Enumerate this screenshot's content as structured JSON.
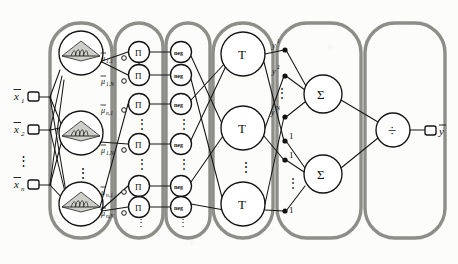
{
  "figure": {
    "type": "diagram",
    "layer_count": 6
  },
  "colors": {
    "layer_border": "#8a8a84",
    "line": "#1a1a1a",
    "node_border": "#1a1a1a",
    "node_fill": "#ffffff",
    "background": "#fcfcfa",
    "text": "#111111"
  },
  "inputs": [
    {
      "label": "x̄1",
      "base": "x",
      "overbar": true,
      "sub": "1",
      "y": 97
    },
    {
      "label": "x̄2",
      "base": "x",
      "overbar": true,
      "sub": "2",
      "y": 130
    },
    {
      "label": "x̄n",
      "base": "x",
      "overbar": true,
      "sub": "n",
      "y": 185
    }
  ],
  "input_vdots": "⋮",
  "layers": [
    {
      "index": 1,
      "name": "membership-layer",
      "x": 50,
      "w": 62
    },
    {
      "index": 2,
      "name": "product-layer",
      "x": 114,
      "w": 50
    },
    {
      "index": 3,
      "name": "negation-layer",
      "x": 166,
      "w": 44
    },
    {
      "index": 4,
      "name": "tnorm-layer",
      "x": 212,
      "w": 62
    },
    {
      "index": 5,
      "name": "summation-layer",
      "x": 276,
      "w": 86
    },
    {
      "index": 6,
      "name": "division-layer",
      "x": 364,
      "w": 82
    }
  ],
  "membership_nodes": [
    {
      "label": "gaussian-membership",
      "cy": 53
    },
    {
      "label": "gaussian-membership",
      "cy": 133
    },
    {
      "label": "gaussian-membership",
      "cy": 204
    }
  ],
  "membership_vdots": "⋮",
  "product_nodes": [
    {
      "symbol": "Π",
      "cy": 52,
      "weight": "μ̄1,1"
    },
    {
      "symbol": "Π",
      "cy": 75,
      "weight": "μ̄1,N"
    },
    {
      "symbol": "Π",
      "cy": 104,
      "weight": "μ̄n,1"
    },
    {
      "symbol": "Π",
      "cy": 144,
      "weight": "μ̄1,N"
    },
    {
      "symbol": "Π",
      "cy": 186,
      "weight": "μ̄n,1"
    },
    {
      "symbol": "Π",
      "cy": 207,
      "weight": "μ̄n,N"
    }
  ],
  "product_symbol": "Π",
  "product_vdots": "⋮",
  "weight_labels": [
    {
      "text": "μ̄1,1",
      "greek": "μ",
      "sub": "1,1",
      "x": 101,
      "y": 59
    },
    {
      "text": "μ̄1,N",
      "greek": "μ",
      "sub": "1,N",
      "x": 101,
      "y": 82
    },
    {
      "text": "μ̄n,1",
      "greek": "μ",
      "sub": "n,1",
      "x": 101,
      "y": 111
    },
    {
      "text": "μ̄1,N",
      "greek": "μ",
      "sub": "1,N",
      "x": 101,
      "y": 151
    },
    {
      "text": "μ̄n,1",
      "greek": "μ",
      "sub": "n,1",
      "x": 101,
      "y": 193
    },
    {
      "text": "μ̄n,N",
      "greek": "μ",
      "sub": "n,N",
      "x": 101,
      "y": 214
    }
  ],
  "negation_nodes": [
    {
      "label": "neg",
      "cy": 52
    },
    {
      "label": "neg",
      "cy": 75
    },
    {
      "label": "neg",
      "cy": 104
    },
    {
      "label": "neg",
      "cy": 144
    },
    {
      "label": "neg",
      "cy": 186
    },
    {
      "label": "neg",
      "cy": 207
    }
  ],
  "negation_label": "neg",
  "negation_vdots": "⋮",
  "tnorm_nodes": [
    {
      "symbol": "T",
      "cy": 54
    },
    {
      "symbol": "T",
      "cy": 128
    },
    {
      "symbol": "T",
      "cy": 204
    }
  ],
  "tnorm_symbol": "T",
  "tnorm_vdots": "⋮",
  "y_labels": [
    {
      "text": "y1",
      "base": "y",
      "sup": "1",
      "x": 272,
      "y": 47
    },
    {
      "text": "y2",
      "base": "y",
      "sup": "2",
      "x": 272,
      "y": 72
    },
    {
      "text": "yN",
      "base": "y",
      "sup": "N",
      "x": 272,
      "y": 113
    }
  ],
  "y_vdots": "⋮",
  "one_labels": [
    {
      "text": "1",
      "x": 285,
      "y": 141
    },
    {
      "text": "1",
      "x": 285,
      "y": 160
    },
    {
      "text": "1",
      "x": 285,
      "y": 211
    }
  ],
  "one_vdots": "⋮",
  "sum_nodes": [
    {
      "symbol": "Σ",
      "cx": 323,
      "cy": 94
    },
    {
      "symbol": "Σ",
      "cx": 323,
      "cy": 174
    }
  ],
  "sum_symbol": "Σ",
  "division_node": {
    "symbol": "÷",
    "cx": 393,
    "cy": 130
  },
  "output": {
    "label": "ȳ",
    "base": "y",
    "overbar": true,
    "x": 444,
    "y": 131
  }
}
